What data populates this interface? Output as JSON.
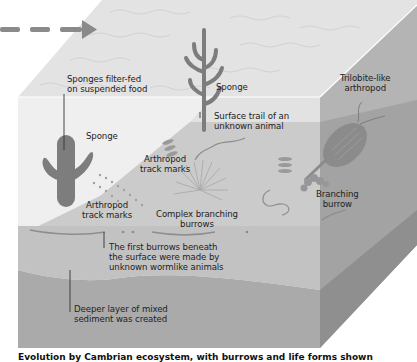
{
  "diagram": {
    "direction_arrow": "dashed-arrow-right",
    "labels": {
      "sponges_filter_fed": [
        "Sponges filter-fed",
        "on suspended food"
      ],
      "sponge_left": "Sponge",
      "sponge_top": "Sponge",
      "surface_trail": [
        "Surface trail of an",
        "unknown animal"
      ],
      "trilobite": [
        "Trilobite-like",
        "arthropod"
      ],
      "arthropod_tracks_upper": [
        "Arthropod",
        "track marks"
      ],
      "arthropod_tracks_lower": [
        "Arthropod",
        "track marks"
      ],
      "complex_burrows": [
        "Complex branching",
        "burrows"
      ],
      "branching_burrow": [
        "Branching",
        "burrow"
      ],
      "first_burrows": [
        "The first burrows beneath",
        "the surface were made by",
        "unknown wormlike animals"
      ],
      "deeper_layer": [
        "Deeper layer of mixed",
        "sediment was created"
      ]
    },
    "colors": {
      "water_top": "#e4e4e4",
      "water_front": "#efefef",
      "seafloor": "#c9c9c9",
      "sediment_light": "#bdbdbd",
      "sediment_deep": "#a9a9a9",
      "side_face": "#9f9f9f",
      "organism": "#7d7d7d",
      "arrow": "#8a8a8a"
    }
  },
  "caption": "Evolution by Cambrian ecosystem, with burrows and life forms shown"
}
